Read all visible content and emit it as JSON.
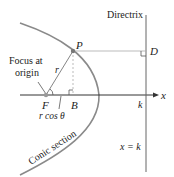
{
  "diagram": {
    "labels": {
      "directrix": "Directrix",
      "point_p": "P",
      "point_d": "D",
      "focus_at": "Focus at",
      "origin": "origin",
      "r": "r",
      "point_f": "F",
      "point_b": "B",
      "r_cos_theta": "r cos θ",
      "k_axis": "k",
      "x_axis": "x",
      "line_eq": "x = k",
      "conic_section": "Conic section"
    },
    "colors": {
      "curve": "#8a8a8a",
      "axis": "#333333",
      "guide": "#bbbbbb",
      "text": "#222222"
    }
  }
}
